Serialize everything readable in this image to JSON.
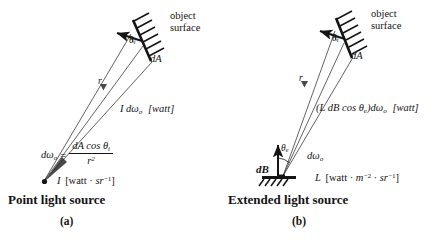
{
  "figure": {
    "background": "#ffffff",
    "ink": "#141414"
  },
  "panels": [
    {
      "id": "a",
      "caption": "Point light source",
      "subcaption": "(a)",
      "surface_label_line1": "object",
      "surface_label_line2": "surface",
      "area_label": "dA",
      "angle_label": "θ",
      "angle_sub": "i",
      "distance_label": "r",
      "flux_label": "I dω",
      "flux_sub": "o",
      "flux_units": "[watt]",
      "solid_angle_symbol": "dω",
      "solid_angle_sub": "o",
      "equals": "=",
      "fraction_numerator": "dA cos θ",
      "fraction_numerator_sub": "i",
      "fraction_denominator": "r",
      "fraction_denominator_sup": "2",
      "source_symbol": "I",
      "source_units_open": "[watt · ",
      "source_units_sr": "sr",
      "source_units_sup": "−1",
      "source_units_close": "]"
    },
    {
      "id": "b",
      "caption": "Extended light source",
      "subcaption": "(b)",
      "surface_label_line1": "object",
      "surface_label_line2": "surface",
      "area_label": "dA",
      "angle_label": "θ",
      "angle_sub": "i",
      "distance_label": "r",
      "flux_label": "(L dB cos θ",
      "flux_sub": "e",
      "flux_label_2": ")dω",
      "flux_sub_2": "o",
      "flux_units": "[watt]",
      "source_angle_label": "θ",
      "source_angle_sub": "e",
      "source_solid_angle": "dω",
      "source_solid_angle_sub": "o",
      "source_area_label": "dB",
      "source_symbol": "L",
      "source_units_open": "[watt · ",
      "source_units_m": "m",
      "source_units_m_sup": "−2",
      "source_units_mid": " · ",
      "source_units_sr": "sr",
      "source_units_sup": "−1",
      "source_units_close": "]"
    }
  ]
}
